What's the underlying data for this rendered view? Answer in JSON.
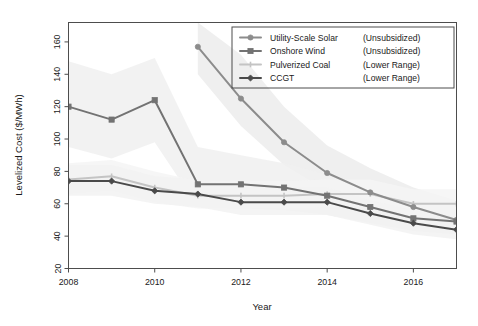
{
  "chart_data": {
    "type": "line",
    "title": "",
    "xlabel": "Year",
    "ylabel": "Levelized Cost ($/MWh)",
    "xlim": [
      2008,
      2017
    ],
    "ylim": [
      20,
      172
    ],
    "grid": false,
    "legend_position": "top-right",
    "x_ticks": [
      2008,
      2010,
      2012,
      2014,
      2016
    ],
    "x_tick_labels": [
      "2008",
      "2010",
      "2012",
      "2014",
      "2016"
    ],
    "y_ticks": [
      20,
      40,
      60,
      80,
      100,
      120,
      140,
      160
    ],
    "y_tick_labels": [
      "20",
      "40",
      "60",
      "80",
      "100",
      "120",
      "140",
      "160"
    ],
    "x": [
      2008,
      2009,
      2010,
      2011,
      2012,
      2013,
      2014,
      2015,
      2016,
      2017
    ],
    "series": [
      {
        "name": "Utility-Scale Solar",
        "qualifier": "(Unsubsidized)",
        "color": "#8c8c8c",
        "marker": "circle",
        "band_color": "#ececec",
        "x": [
          2011,
          2012,
          2013,
          2014,
          2015,
          2016,
          2017
        ],
        "values": [
          157,
          125,
          98,
          79,
          67,
          58,
          50
        ],
        "band_upper": [
          172,
          152,
          120,
          96,
          82,
          70,
          62
        ],
        "band_lower": [
          140,
          108,
          84,
          68,
          58,
          50,
          44
        ]
      },
      {
        "name": "Onshore Wind",
        "qualifier": "(Unsubsidized)",
        "color": "#737373",
        "marker": "square",
        "band_color": "#f0f0f0",
        "x": [
          2008,
          2009,
          2010,
          2011,
          2012,
          2013,
          2014,
          2015,
          2016,
          2017
        ],
        "values": [
          120,
          112,
          124,
          72,
          72,
          70,
          65,
          58,
          51,
          49
        ],
        "band_upper": [
          148,
          140,
          150,
          95,
          90,
          85,
          78,
          70,
          62,
          58
        ],
        "band_lower": [
          95,
          88,
          98,
          58,
          57,
          56,
          53,
          48,
          43,
          41
        ]
      },
      {
        "name": "Pulverized Coal",
        "qualifier": "(Lower Range)",
        "color": "#c4c4c4",
        "marker": "line",
        "band_color": "#f5f5f5",
        "x": [
          2008,
          2009,
          2010,
          2011,
          2012,
          2013,
          2014,
          2015,
          2016,
          2017
        ],
        "values": [
          75,
          77,
          70,
          65,
          65,
          65,
          66,
          66,
          60,
          60
        ],
        "band_upper": [
          85,
          87,
          80,
          74,
          74,
          74,
          75,
          75,
          69,
          69
        ],
        "band_lower": [
          66,
          68,
          61,
          57,
          57,
          57,
          58,
          58,
          52,
          52
        ]
      },
      {
        "name": "CCGT",
        "qualifier": "(Lower Range)",
        "color": "#4a4a4a",
        "marker": "diamond",
        "band_color": "#f2f2f2",
        "x": [
          2008,
          2009,
          2010,
          2011,
          2012,
          2013,
          2014,
          2015,
          2016,
          2017
        ],
        "values": [
          74,
          74,
          68,
          66,
          61,
          61,
          61,
          54,
          48,
          44
        ],
        "band_upper": [
          84,
          84,
          77,
          75,
          70,
          70,
          70,
          62,
          56,
          52
        ],
        "band_lower": [
          65,
          65,
          60,
          58,
          53,
          53,
          53,
          47,
          41,
          38
        ]
      }
    ]
  },
  "legend": {
    "entries": [
      {
        "label": "Utility-Scale Solar",
        "qualifier": "(Unsubsidized)"
      },
      {
        "label": "Onshore Wind",
        "qualifier": "(Unsubsidized)"
      },
      {
        "label": "Pulverized Coal",
        "qualifier": "(Lower Range)"
      },
      {
        "label": "CCGT",
        "qualifier": "(Lower Range)"
      }
    ]
  },
  "axes": {
    "x_title": "Year",
    "y_title": "Levelized Cost ($/MWh)"
  }
}
